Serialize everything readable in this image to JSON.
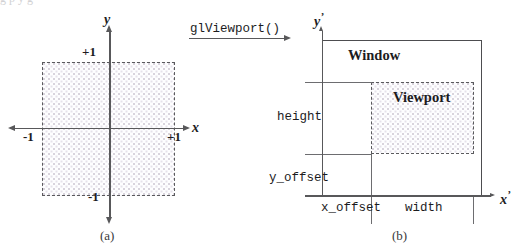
{
  "figure": {
    "transform_label": "glViewport()",
    "top_bleed_text": "g        p        y          g"
  },
  "panel_a": {
    "caption": "(a)",
    "axis_x": "x",
    "axis_y": "y",
    "ticks": {
      "x_neg": "-1",
      "x_pos": "+1",
      "y_pos": "+1",
      "y_neg": "-1"
    }
  },
  "panel_b": {
    "caption": "(b)",
    "axis_x": "x",
    "axis_y": "y",
    "axis_prime": "’",
    "regions": {
      "window": "Window",
      "viewport": "Viewport"
    },
    "dimensions": {
      "height": "height",
      "y_offset": "y_offset",
      "x_offset": "x_offset",
      "width": "width"
    }
  },
  "colors": {
    "axis": "#58585a",
    "outline": "#4d4d50",
    "dashed": "#5a5a5d",
    "guide": "#6d6d70",
    "text": "#1c1c1e",
    "dot_fill": "#d9d4dd"
  }
}
